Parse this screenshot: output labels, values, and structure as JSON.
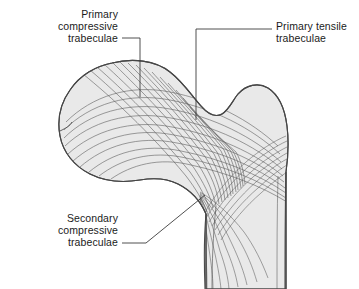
{
  "figure": {
    "background_color": "#ffffff",
    "bone_fill_color": "#e9e9e9",
    "bone_outline_color": "#4a4a4a",
    "trabeculae_line_color": "#5a5a5a",
    "leader_line_color": "#3c3c3c",
    "text_color": "#1b1b1b"
  },
  "labels": {
    "primary_compressive": {
      "lines": [
        "Primary",
        "compressive",
        "trabeculae"
      ],
      "align": "right"
    },
    "primary_tensile": {
      "lines": [
        "Primary tensile",
        "trabeculae"
      ],
      "align": "left"
    },
    "secondary_compressive": {
      "lines": [
        "Secondary",
        "compressive",
        "trabeculae"
      ],
      "align": "right"
    }
  }
}
